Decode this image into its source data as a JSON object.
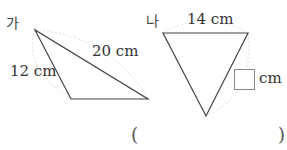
{
  "figures": [
    {
      "label": "가",
      "sides": {
        "left": "12 cm",
        "right": "20 cm"
      }
    },
    {
      "label": "나",
      "sides": {
        "top": "14 cm",
        "right_unit": "cm"
      },
      "unknown_side": "answer-box"
    }
  ],
  "answer": {
    "open_paren": "(",
    "close_paren": ")",
    "value": ""
  }
}
